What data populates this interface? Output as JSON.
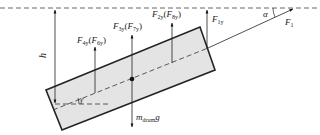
{
  "diagram": {
    "title": "",
    "reference_line": {
      "style": "dashed",
      "color": "#555555"
    },
    "body": {
      "shape": "tilted rectangle (drum)",
      "fill": "#e4e4e4",
      "stroke": "#222222"
    },
    "labels": {
      "h": {
        "main": "h"
      },
      "gamma": {
        "main": "γ"
      },
      "alpha": {
        "main": "α"
      },
      "F1": {
        "main": "F",
        "sub": "1"
      },
      "F1y": {
        "main": "F",
        "sub": "1y"
      },
      "F2y": {
        "main": "F",
        "sub": "2y",
        "paren_main": "F",
        "paren_sub": "8y"
      },
      "F3y": {
        "main": "F",
        "sub": "3y",
        "paren_main": "F",
        "paren_sub": "7y"
      },
      "F4y": {
        "main": "F",
        "sub": "4y",
        "paren_main": "F",
        "paren_sub": "6y"
      },
      "weight": {
        "main": "m",
        "sub": "drum",
        "tail": "g"
      }
    },
    "punct": {
      "open": "(",
      "close": ")"
    }
  }
}
